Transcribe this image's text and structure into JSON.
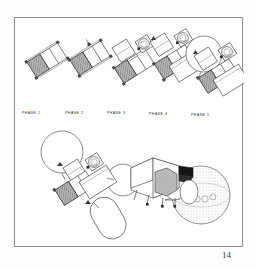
{
  "page": {
    "number": "14",
    "background_color": "#fdfdfd",
    "frame_color": "#8e8e8e"
  },
  "figure": {
    "title": "",
    "type": "technical-line-drawing",
    "palette": {
      "line": "#3a3a3a",
      "light_line": "#6e6e6e",
      "shaded_module_fill": "#a8a8a8",
      "shaded_module_dark": "#7e7e7e",
      "solid_black": "#161616",
      "tank_fill": "#ffffff",
      "stipple": "#8a8a8a"
    },
    "phase_sequence": [
      {
        "id": "phase-1",
        "label": "PHASE 1",
        "label_x": 7,
        "label_y": 95,
        "origin_x": 10,
        "origin_y": 40,
        "modules": [
          "core-module",
          "shaded-module"
        ],
        "tanks": 0
      },
      {
        "id": "phase-2",
        "label": "PHASE 2",
        "label_x": 50,
        "label_y": 95,
        "origin_x": 53,
        "origin_y": 38,
        "modules": [
          "core-module",
          "shaded-module",
          "node-module"
        ],
        "tanks": 0
      },
      {
        "id": "phase-3",
        "label": "PHASE 3",
        "label_x": 93,
        "label_y": 95,
        "origin_x": 95,
        "origin_y": 32,
        "modules": [
          "core-module",
          "shaded-module",
          "node-module",
          "docking-unit"
        ],
        "tanks": 0
      },
      {
        "id": "phase-4",
        "label": "PHASE 4",
        "label_x": 135,
        "label_y": 95,
        "origin_x": 133,
        "origin_y": 28,
        "modules": [
          "core-module",
          "shaded-module",
          "node-module",
          "docking-unit",
          "lab-module"
        ],
        "tanks": 0
      },
      {
        "id": "phase-5",
        "label": "PHASE 5",
        "label_x": 177,
        "label_y": 95,
        "origin_x": 172,
        "origin_y": 14,
        "modules": [
          "core-module",
          "shaded-module",
          "node-module",
          "docking-unit",
          "lab-module"
        ],
        "tanks": 1
      }
    ],
    "assembly_view": {
      "id": "full-assembly",
      "origin_x": 18,
      "origin_y": 118,
      "tanks_spherical": 2,
      "tanks_capsule": 1,
      "modules": [
        "core-module",
        "shaded-module",
        "node-module",
        "docking-unit",
        "lab-module",
        "truss"
      ]
    },
    "perspective_view": {
      "id": "perspective-assembly",
      "origin_x": 120,
      "origin_y": 140,
      "features": [
        "boxy-module",
        "cylinder-tank",
        "solid-black-panel",
        "stippled-sphere",
        "landing-legs"
      ]
    }
  }
}
